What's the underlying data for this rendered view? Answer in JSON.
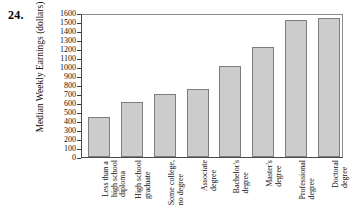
{
  "problem_number": "24.",
  "chart_data": {
    "type": "bar",
    "title": "",
    "xlabel": "",
    "ylabel": "Median Weekly Earnings (dollars)",
    "ylim": [
      0,
      1600
    ],
    "ytick_step": 100,
    "yticks": [
      "1600",
      "1500",
      "1400",
      "1300",
      "1200",
      "1100",
      "1000",
      "900",
      "800",
      "700",
      "600",
      "500",
      "400",
      "300",
      "200",
      "100",
      "0"
    ],
    "grid": false,
    "legend": "none",
    "bar_color": "#cccccc",
    "bar_edge_color": "#7d7d7d",
    "categories": [
      "Less than a high school diploma",
      "High school graduate",
      "Some college, no degree",
      "Associate degree",
      "Bachelor's degree",
      "Master's degree",
      "Professional degree",
      "Doctoral degree"
    ],
    "category_lines": [
      [
        "Less than a",
        "high school",
        "diploma"
      ],
      [
        "High school",
        "graduate",
        ""
      ],
      [
        "Some college,",
        "no degree",
        ""
      ],
      [
        "Associate",
        "degree",
        ""
      ],
      [
        "Bachelor's",
        "degree",
        ""
      ],
      [
        "Master's",
        "degree",
        ""
      ],
      [
        "Professional",
        "degree",
        ""
      ],
      [
        "Doctoral",
        "degree",
        ""
      ]
    ],
    "values": [
      450,
      615,
      700,
      755,
      1010,
      1225,
      1520,
      1550
    ]
  }
}
